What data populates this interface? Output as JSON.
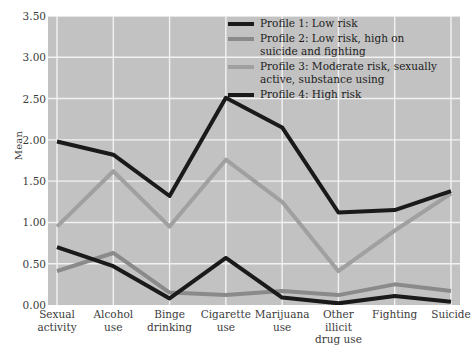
{
  "chart_data": {
    "type": "line",
    "title": "",
    "xlabel": "",
    "ylabel": "Mean",
    "ylim": [
      0.0,
      3.5
    ],
    "ytick_labels": [
      "0.00",
      "0.50",
      "1.00",
      "1.50",
      "2.00",
      "2.50",
      "3.00",
      "3.50"
    ],
    "ytick_values": [
      0.0,
      0.5,
      1.0,
      1.5,
      2.0,
      2.5,
      3.0,
      3.5
    ],
    "grid": true,
    "legend_position": "top-right",
    "plot_background": "#c2c2c2",
    "gridline_color": "#f2f2f2",
    "categories": [
      "Sexual\nactivity",
      "Alcohol\nuse",
      "Binge\ndrinking",
      "Cigarette\nuse",
      "Marijuana\nuse",
      "Other\nillicit\ndrug use",
      "Fighting",
      "Suicide"
    ],
    "series": [
      {
        "name": "Profile 1: Low risk",
        "color": "#1a1a1a",
        "values": [
          0.7,
          0.47,
          0.08,
          0.57,
          0.09,
          0.02,
          0.11,
          0.04
        ]
      },
      {
        "name": "Profile 2: Low risk, high on\nsuicide and fighting",
        "color": "#8a8a8a",
        "values": [
          0.41,
          0.63,
          0.15,
          0.12,
          0.17,
          0.12,
          0.25,
          0.17
        ]
      },
      {
        "name": "Profile 3: Moderate risk, sexually\nactive, substance using",
        "color": "#a0a0a0",
        "values": [
          0.95,
          1.62,
          0.95,
          1.76,
          1.25,
          0.41,
          0.9,
          1.35
        ]
      },
      {
        "name": "Profile 4: High risk",
        "color": "#1a1a1a",
        "values": [
          1.98,
          1.82,
          1.32,
          2.51,
          2.15,
          1.12,
          1.15,
          1.38
        ]
      }
    ]
  }
}
